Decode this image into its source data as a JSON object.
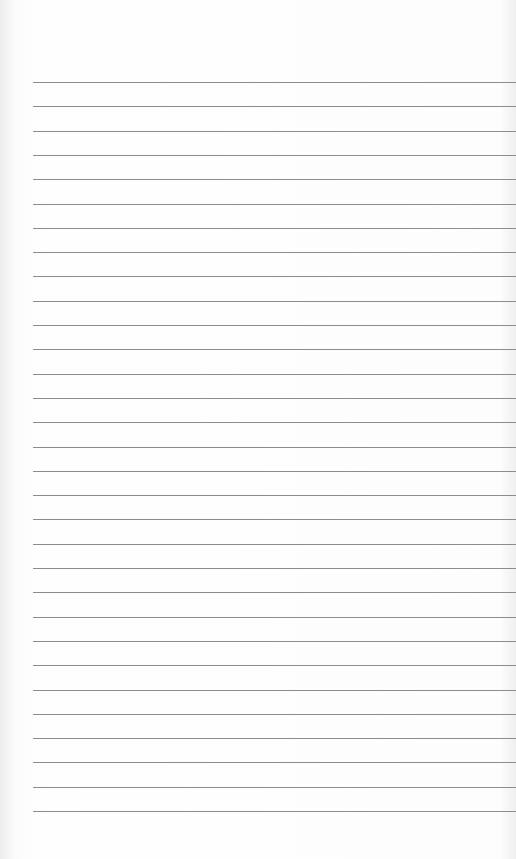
{
  "page": {
    "type": "lined-paper",
    "line_count": 31,
    "first_line_y": 82,
    "line_spacing": 24.3,
    "line_left": 33,
    "line_color": "#8c8c8c",
    "background_color": "#fdfdfd"
  }
}
